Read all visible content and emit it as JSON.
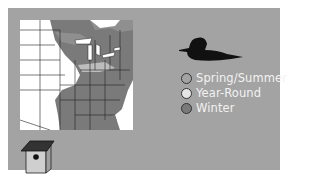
{
  "range_map": {
    "colors": {
      "panel_background": "#a3a3a3",
      "map_background": "#ffffff",
      "range_fill": "#7a7a7a",
      "spring_summer": "#a3a3a3",
      "year_round": "#e6e6e6",
      "winter": "#7a7a7a"
    },
    "legend": [
      {
        "label": "Spring/Summer",
        "icon": "circle-outline-icon"
      },
      {
        "label": "Year-Round",
        "icon": "circle-light-icon"
      },
      {
        "label": "Winter",
        "icon": "circle-dark-icon"
      }
    ],
    "icons": {
      "bird": "duck-silhouette-icon",
      "house": "birdhouse-icon"
    }
  }
}
